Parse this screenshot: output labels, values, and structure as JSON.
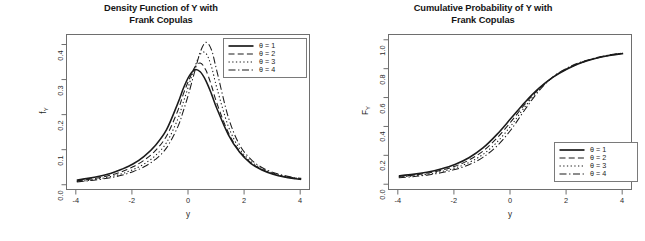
{
  "figure": {
    "background": "#ffffff",
    "curve_color": "#1b1b1b"
  },
  "panels": [
    {
      "id": "density",
      "title_line1": "Density Function of Y with",
      "title_line2": "Frank Copulas",
      "legend_position": "top-right",
      "legend": [
        {
          "label_theta": "θ",
          "label_eq": "=",
          "label_value": "1",
          "dash": "solid"
        },
        {
          "label_theta": "θ",
          "label_eq": "=",
          "label_value": "2",
          "dash": "dashed"
        },
        {
          "label_theta": "θ",
          "label_eq": "=",
          "label_value": "3",
          "dash": "dotted"
        },
        {
          "label_theta": "θ",
          "label_eq": "=",
          "label_value": "4",
          "dash": "dashdot"
        }
      ]
    },
    {
      "id": "cumulative",
      "title_line1": "Cumulative Probability of Y with",
      "title_line2": "Frank Copulas",
      "legend_position": "bottom-right",
      "legend": [
        {
          "label_theta": "θ",
          "label_eq": "=",
          "label_value": "1",
          "dash": "solid"
        },
        {
          "label_theta": "θ",
          "label_eq": "=",
          "label_value": "2",
          "dash": "dashed"
        },
        {
          "label_theta": "θ",
          "label_eq": "=",
          "label_value": "3",
          "dash": "dotted"
        },
        {
          "label_theta": "θ",
          "label_eq": "=",
          "label_value": "4",
          "dash": "dashdot"
        }
      ]
    }
  ],
  "chart_data": [
    {
      "type": "line",
      "id": "density",
      "title": "Density Function of Y with Frank Copulas",
      "xlabel": "y",
      "ylabel": "f_Y",
      "ylabel_base": "f",
      "ylabel_sub": "Y",
      "xlim": [
        -4.35,
        4.35
      ],
      "ylim": [
        -0.015,
        0.43
      ],
      "xticks": [
        -4,
        -2,
        0,
        2,
        4
      ],
      "xticklabels": [
        "-4",
        "-2",
        "0",
        "2",
        "4"
      ],
      "yticks": [
        0.0,
        0.1,
        0.2,
        0.3,
        0.4
      ],
      "yticklabels": [
        "0.0",
        "0.1",
        "0.2",
        "0.3",
        "0.4"
      ],
      "grid": false,
      "legend_position": "top-right",
      "x": [
        -4.0,
        -3.6,
        -3.2,
        -2.8,
        -2.4,
        -2.0,
        -1.6,
        -1.2,
        -0.8,
        -0.4,
        -0.2,
        0.0,
        0.2,
        0.4,
        0.6,
        0.8,
        1.0,
        1.4,
        1.8,
        2.2,
        2.6,
        3.0,
        3.4,
        3.8,
        4.0
      ],
      "series": [
        {
          "name": "θ = 1",
          "dash": "solid",
          "peak_x": 0.15,
          "peak_y": 0.332,
          "values": [
            0.016,
            0.021,
            0.027,
            0.035,
            0.047,
            0.062,
            0.084,
            0.115,
            0.16,
            0.235,
            0.278,
            0.312,
            0.331,
            0.325,
            0.3,
            0.262,
            0.219,
            0.146,
            0.096,
            0.064,
            0.045,
            0.033,
            0.025,
            0.02,
            0.018
          ]
        },
        {
          "name": "θ = 2",
          "dash": "dashed",
          "peak_x": 0.28,
          "peak_y": 0.352,
          "values": [
            0.014,
            0.018,
            0.023,
            0.03,
            0.04,
            0.054,
            0.073,
            0.1,
            0.142,
            0.214,
            0.262,
            0.302,
            0.337,
            0.35,
            0.33,
            0.286,
            0.234,
            0.152,
            0.099,
            0.066,
            0.047,
            0.034,
            0.026,
            0.021,
            0.019
          ]
        },
        {
          "name": "θ = 3",
          "dash": "dotted",
          "peak_x": 0.42,
          "peak_y": 0.382,
          "values": [
            0.012,
            0.015,
            0.02,
            0.026,
            0.034,
            0.046,
            0.062,
            0.086,
            0.123,
            0.19,
            0.239,
            0.288,
            0.337,
            0.375,
            0.378,
            0.34,
            0.277,
            0.17,
            0.106,
            0.07,
            0.049,
            0.036,
            0.027,
            0.022,
            0.02
          ]
        },
        {
          "name": "θ = 4",
          "dash": "dashdot",
          "peak_x": 0.55,
          "peak_y": 0.41,
          "values": [
            0.011,
            0.014,
            0.018,
            0.023,
            0.03,
            0.04,
            0.054,
            0.075,
            0.108,
            0.168,
            0.214,
            0.266,
            0.325,
            0.381,
            0.409,
            0.388,
            0.325,
            0.196,
            0.117,
            0.076,
            0.052,
            0.038,
            0.029,
            0.023,
            0.021
          ]
        }
      ]
    },
    {
      "type": "line",
      "id": "cumulative",
      "title": "Cumulative Probability of Y with Frank Copulas",
      "xlabel": "y",
      "ylabel": "F_Y",
      "ylabel_base": "F",
      "ylabel_sub": "Y",
      "xlim": [
        -4.35,
        4.35
      ],
      "ylim": [
        -0.04,
        1.04
      ],
      "xticks": [
        -4,
        -2,
        0,
        2,
        4
      ],
      "xticklabels": [
        "-4",
        "-2",
        "0",
        "2",
        "4"
      ],
      "yticks": [
        0.0,
        0.2,
        0.4,
        0.6,
        0.8,
        1.0
      ],
      "yticklabels": [
        "0.0",
        "0.2",
        "0.4",
        "0.6",
        "0.8",
        "1.0"
      ],
      "grid": false,
      "legend_position": "bottom-right",
      "x": [
        -4.0,
        -3.5,
        -3.0,
        -2.5,
        -2.0,
        -1.5,
        -1.0,
        -0.5,
        0.0,
        0.5,
        1.0,
        1.5,
        2.0,
        2.5,
        3.0,
        3.5,
        4.0
      ],
      "series": [
        {
          "name": "θ = 1",
          "dash": "solid",
          "values": [
            0.065,
            0.075,
            0.09,
            0.112,
            0.143,
            0.19,
            0.258,
            0.352,
            0.463,
            0.575,
            0.672,
            0.748,
            0.805,
            0.848,
            0.878,
            0.898,
            0.912
          ]
        },
        {
          "name": "θ = 2",
          "dash": "dashed",
          "values": [
            0.06,
            0.07,
            0.083,
            0.103,
            0.131,
            0.174,
            0.236,
            0.327,
            0.44,
            0.562,
            0.668,
            0.748,
            0.806,
            0.848,
            0.878,
            0.899,
            0.913
          ]
        },
        {
          "name": "θ = 3",
          "dash": "dotted",
          "values": [
            0.056,
            0.064,
            0.076,
            0.094,
            0.119,
            0.157,
            0.213,
            0.298,
            0.412,
            0.544,
            0.662,
            0.749,
            0.809,
            0.85,
            0.879,
            0.9,
            0.914
          ]
        },
        {
          "name": "θ = 4",
          "dash": "dashdot",
          "values": [
            0.052,
            0.059,
            0.07,
            0.086,
            0.108,
            0.142,
            0.193,
            0.272,
            0.384,
            0.524,
            0.654,
            0.75,
            0.812,
            0.853,
            0.881,
            0.902,
            0.915
          ]
        }
      ]
    }
  ]
}
